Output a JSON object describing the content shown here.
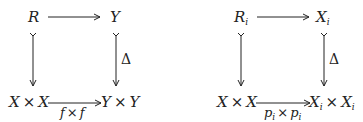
{
  "diagrams": [
    {
      "id": "left",
      "top_left": {
        "base": "R",
        "sub": ""
      },
      "top_right": {
        "base": "Y",
        "sub": ""
      },
      "bottom_left": {
        "a": "X",
        "op": "×",
        "b": "X",
        "sub": ""
      },
      "bottom_right": {
        "a": "Y",
        "op": "×",
        "b": "Y",
        "sub": ""
      },
      "right_arrow_label": "Δ",
      "bottom_arrow_label": {
        "a": "f",
        "op": "×",
        "b": "f",
        "sub": ""
      }
    },
    {
      "id": "right",
      "top_left": {
        "base": "R",
        "sub": "i"
      },
      "top_right": {
        "base": "X",
        "sub": "i"
      },
      "bottom_left": {
        "a": "X",
        "op": "×",
        "b": "X",
        "sub": ""
      },
      "bottom_right": {
        "a": "X",
        "op": "×",
        "b": "X",
        "sub": "i"
      },
      "right_arrow_label": "Δ",
      "bottom_arrow_label": {
        "a": "p",
        "op": "×",
        "b": "p",
        "sub": "i"
      }
    }
  ],
  "colors": {
    "ink": "#222222",
    "background": "#ffffff"
  }
}
